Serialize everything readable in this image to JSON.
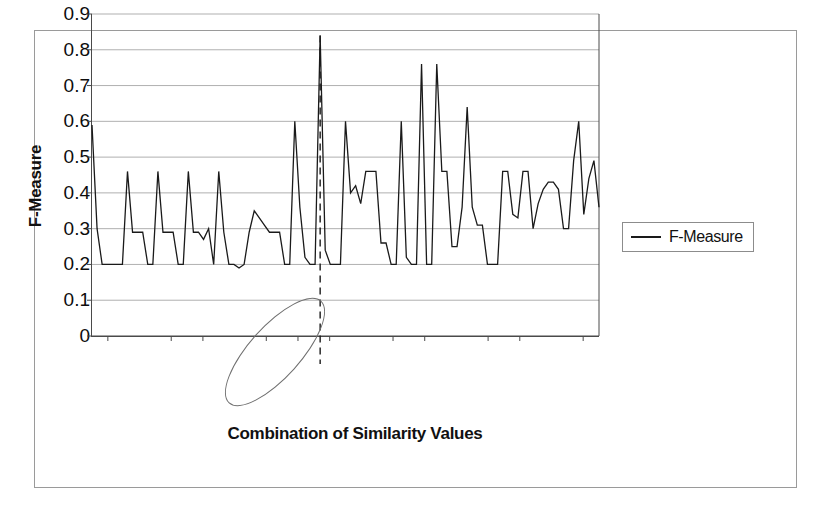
{
  "chart_data": {
    "type": "line",
    "title": "",
    "subtitle": "",
    "xlabel": "Combination of Similarity Values",
    "ylabel": "F-Measure",
    "ylim": [
      0,
      0.9
    ],
    "grid": true,
    "legend_position": "right",
    "legend_entries": [
      "F-Measure"
    ],
    "y_ticks": [
      "0",
      "0.1",
      "0.2",
      "0.3",
      "0.4",
      "0.5",
      "0.6",
      "0.7",
      "0.8",
      "0.9"
    ],
    "y_tick_values": [
      0,
      0.1,
      0.2,
      0.3,
      0.4,
      0.5,
      0.6,
      0.7,
      0.8,
      0.9
    ],
    "x_tick_labels": [
      "(0.9,0.8,0.8,0.01)",
      "....",
      "(0.9,0.2,0.2,0.01)",
      "(0.8,0.8,0.8,0.01)",
      "....",
      "(0.8,0.5,0.6,0.01)",
      "(0.8,0.2,0.2,0.01)",
      "(0.7,0.6,0.6,0.01)",
      "....",
      "(0.7,0.2,0.2,0.01)",
      "(0.6,0.6,0.6,0.01)",
      "....",
      "(0.6,0.2,0.2,0.01)",
      "(0.5,0.5,0.5,0.01)",
      "....",
      "(0.5,0.2,0.2,0.01)"
    ],
    "annotation_highlight_label": "(0.8,0.5,0.6,0.01)",
    "annotation_marker": "dashed vertical line at peak",
    "peak_value": 0.84,
    "series": [
      {
        "name": "F-Measure",
        "color": "#1a1a1a",
        "values": [
          0.59,
          0.3,
          0.2,
          0.2,
          0.2,
          0.2,
          0.2,
          0.46,
          0.29,
          0.29,
          0.29,
          0.2,
          0.2,
          0.46,
          0.29,
          0.29,
          0.29,
          0.2,
          0.2,
          0.46,
          0.29,
          0.29,
          0.27,
          0.3,
          0.2,
          0.46,
          0.29,
          0.2,
          0.2,
          0.19,
          0.2,
          0.29,
          0.35,
          0.33,
          0.31,
          0.29,
          0.29,
          0.29,
          0.2,
          0.2,
          0.6,
          0.36,
          0.22,
          0.2,
          0.2,
          0.84,
          0.24,
          0.2,
          0.2,
          0.2,
          0.6,
          0.4,
          0.42,
          0.37,
          0.46,
          0.46,
          0.46,
          0.26,
          0.26,
          0.2,
          0.2,
          0.6,
          0.22,
          0.2,
          0.2,
          0.76,
          0.2,
          0.2,
          0.76,
          0.46,
          0.46,
          0.25,
          0.25,
          0.36,
          0.64,
          0.36,
          0.31,
          0.31,
          0.2,
          0.2,
          0.2,
          0.46,
          0.46,
          0.34,
          0.33,
          0.46,
          0.46,
          0.3,
          0.37,
          0.41,
          0.43,
          0.43,
          0.41,
          0.3,
          0.3,
          0.49,
          0.6,
          0.34,
          0.44,
          0.49,
          0.36
        ]
      }
    ]
  },
  "legend": {
    "label": "F-Measure",
    "swatch": "line-swatch"
  },
  "axes": {
    "y_title": "F-Measure",
    "x_title": "Combination of Similarity Values"
  }
}
